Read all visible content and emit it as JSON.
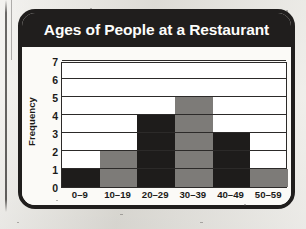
{
  "card": {
    "title": "Ages of People at a Restaurant"
  },
  "chart_data": {
    "type": "bar",
    "title": "Ages of People at a Restaurant",
    "xlabel": "Age",
    "ylabel": "Frequency",
    "categories": [
      "0–9",
      "10–19",
      "20–29",
      "30–39",
      "40–49",
      "50–59"
    ],
    "values": [
      1,
      2,
      4,
      5,
      3,
      1
    ],
    "ylim": [
      0,
      7
    ],
    "yticks": [
      0,
      1,
      2,
      3,
      4,
      5,
      6,
      7
    ],
    "ytick_labels": [
      "0",
      "1",
      "2",
      "3",
      "4",
      "5",
      "6",
      "7"
    ],
    "grid": "horizontal",
    "legend": "none",
    "bar_gap": 0,
    "bar_colors": [
      "#1e1c1b",
      "#7d7b78",
      "#1e1c1b",
      "#7d7b78",
      "#1e1c1b",
      "#7d7b78"
    ],
    "colors": {
      "bar_dark": "#1e1c1b",
      "bar_gray": "#7d7b78",
      "plot_background": "#ffffff",
      "axis": "#2c2a29",
      "title_bar": "#201e1d",
      "title_text": "#fdfdfb",
      "card_background": "#fbfaf7",
      "page_background": "#e9e7e1"
    }
  }
}
